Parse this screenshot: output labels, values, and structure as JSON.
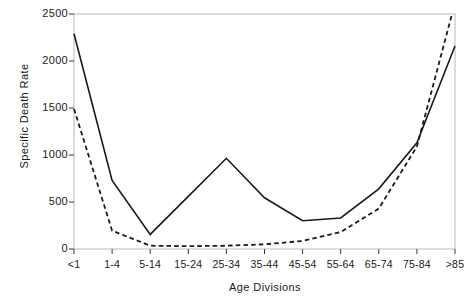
{
  "chart_data": {
    "type": "line",
    "title": "",
    "xlabel": "Age Divisions",
    "ylabel": "Specific Death Rate",
    "categories": [
      "<1",
      "1-4",
      "5-14",
      "15-24",
      "25-34",
      "35-44",
      "45-54",
      "55-64",
      "65-74",
      "75-84",
      ">85"
    ],
    "yticks": [
      0,
      500,
      1000,
      1500,
      2000,
      2500
    ],
    "ylim": [
      0,
      2500
    ],
    "grid": false,
    "legend": "none",
    "series": [
      {
        "name": "solid",
        "style": "solid",
        "color": "#1a1a1a",
        "values": [
          2290,
          730,
          155,
          560,
          965,
          545,
          300,
          330,
          640,
          1130,
          2160
        ]
      },
      {
        "name": "dashed",
        "style": "dashed",
        "color": "#1a1a1a",
        "values": [
          1490,
          195,
          35,
          30,
          35,
          50,
          85,
          180,
          430,
          1090,
          2620
        ]
      }
    ]
  },
  "axes": {
    "ylabel_text": "Specific Death Rate",
    "xlabel_text": "Age Divisions",
    "ytick_labels": [
      "2500",
      "2000",
      "1500",
      "1000",
      "500",
      "0"
    ],
    "xtick_labels": [
      "<1",
      "1-4",
      "5-14",
      "15-24",
      "25-34",
      "35-44",
      "45-54",
      "55-64",
      "65-74",
      "75-84",
      ">85"
    ]
  }
}
